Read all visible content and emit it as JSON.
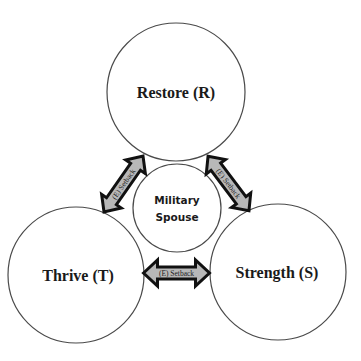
{
  "diagram": {
    "nodes": {
      "restore": {
        "label": "Restore (R)",
        "cx": 176,
        "cy": 92,
        "r": 69
      },
      "thrive": {
        "label": "Thrive (T)",
        "cx": 76,
        "cy": 275,
        "r": 68
      },
      "strength": {
        "label": "Strength (S)",
        "cx": 278,
        "cy": 272,
        "r": 68
      },
      "center": {
        "label_line1": "Military",
        "label_line2": "Spouse",
        "cx": 177,
        "cy": 208,
        "r": 44
      }
    },
    "edges": {
      "restore_thrive": {
        "label": "(E) Setback",
        "from": "Restore (R)",
        "to": "Thrive (T)"
      },
      "restore_strength": {
        "label": "(E) Setback",
        "from": "Restore (R)",
        "to": "Strength (S)"
      },
      "thrive_strength": {
        "label": "(E) Setback",
        "from": "Thrive (T)",
        "to": "Strength (S)"
      }
    },
    "colors": {
      "circle_stroke": "#4a4a4a",
      "arrow_fill": "#b8b8b8",
      "arrow_stroke": "#111111",
      "text": "#1a1a1a"
    }
  }
}
